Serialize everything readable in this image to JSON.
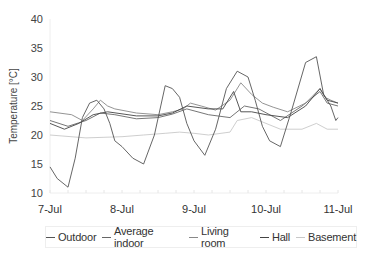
{
  "chart_data": {
    "type": "line",
    "title": "",
    "xlabel": "",
    "ylabel": "Temperature [°C]",
    "ylim": [
      10,
      40
    ],
    "yticks": [
      10,
      15,
      20,
      25,
      30,
      35,
      40
    ],
    "xticks": [
      "7-Jul",
      "8-Jul",
      "9-Jul",
      "10-Jul",
      "11-Jul"
    ],
    "x_unit": "days since 7-Jul",
    "grid": false,
    "legend_position": "bottom",
    "series": [
      {
        "name": "Outdoor",
        "color": "#555555",
        "x": [
          0,
          0.1,
          0.25,
          0.35,
          0.45,
          0.55,
          0.65,
          0.75,
          0.83,
          0.9,
          1.0,
          1.15,
          1.3,
          1.45,
          1.6,
          1.7,
          1.8,
          1.9,
          2.0,
          2.15,
          2.3,
          2.45,
          2.6,
          2.75,
          2.85,
          2.95,
          3.05,
          3.2,
          3.35,
          3.55,
          3.7,
          3.8,
          3.9,
          3.97,
          4.0
        ],
        "y": [
          14.5,
          12.5,
          11.0,
          16.0,
          23.0,
          25.5,
          26.0,
          24.5,
          22.0,
          19.0,
          18.0,
          16.0,
          15.0,
          20.0,
          28.5,
          28.0,
          26.5,
          22.0,
          19.0,
          16.5,
          21.0,
          28.0,
          31.0,
          30.0,
          26.0,
          21.5,
          19.0,
          18.0,
          24.0,
          32.5,
          33.5,
          27.0,
          25.0,
          22.5,
          23.0
        ]
      },
      {
        "name": "Average indoor",
        "color": "#666666",
        "x": [
          0,
          0.25,
          0.5,
          0.7,
          0.9,
          1.2,
          1.5,
          1.7,
          1.9,
          2.2,
          2.5,
          2.7,
          2.9,
          3.2,
          3.5,
          3.75,
          3.85,
          4.0
        ],
        "y": [
          22.5,
          21.5,
          22.5,
          23.8,
          23.5,
          22.8,
          23.0,
          23.6,
          24.5,
          23.5,
          23.0,
          25.0,
          24.5,
          22.5,
          25.0,
          27.5,
          25.5,
          25.0
        ]
      },
      {
        "name": "Living room",
        "color": "#888888",
        "x": [
          0,
          0.3,
          0.45,
          0.6,
          0.7,
          0.8,
          0.9,
          1.2,
          1.5,
          1.7,
          1.85,
          1.95,
          2.1,
          2.3,
          2.5,
          2.65,
          2.8,
          2.95,
          3.1,
          3.3,
          3.55,
          3.75,
          3.82,
          3.9,
          4.0
        ],
        "y": [
          24.0,
          23.5,
          22.5,
          24.5,
          26.0,
          25.0,
          24.5,
          23.8,
          23.5,
          24.0,
          24.5,
          25.5,
          25.0,
          24.3,
          26.0,
          29.0,
          27.0,
          25.5,
          24.8,
          24.0,
          25.5,
          28.0,
          26.5,
          26.0,
          25.5
        ]
      },
      {
        "name": "Hall",
        "color": "#444444",
        "x": [
          0,
          0.2,
          0.4,
          0.6,
          0.8,
          1.2,
          1.5,
          1.7,
          1.9,
          2.2,
          2.4,
          2.55,
          2.65,
          2.8,
          3.0,
          3.3,
          3.55,
          3.75,
          3.85,
          4.0
        ],
        "y": [
          22.0,
          21.0,
          22.0,
          23.5,
          24.0,
          23.3,
          23.3,
          23.8,
          25.0,
          24.5,
          24.5,
          27.5,
          24.0,
          24.0,
          23.5,
          23.0,
          25.0,
          28.0,
          26.0,
          25.5
        ]
      },
      {
        "name": "Basement",
        "color": "#c8c8c8",
        "x": [
          0,
          0.5,
          1.0,
          1.3,
          1.6,
          1.8,
          2.0,
          2.2,
          2.5,
          2.6,
          2.8,
          3.0,
          3.2,
          3.5,
          3.7,
          3.85,
          4.0
        ],
        "y": [
          20.0,
          19.5,
          19.7,
          20.0,
          20.3,
          20.5,
          20.3,
          20.0,
          20.5,
          22.5,
          23.0,
          22.0,
          21.0,
          21.0,
          22.0,
          21.0,
          21.0
        ]
      }
    ]
  },
  "legend": {
    "items": [
      {
        "label": "Outdoor",
        "color": "#555555"
      },
      {
        "label": "Average indoor",
        "color": "#666666"
      },
      {
        "label": "Living room",
        "color": "#888888"
      },
      {
        "label": "Hall",
        "color": "#444444"
      },
      {
        "label": "Basement",
        "color": "#c8c8c8"
      }
    ]
  },
  "axes": {
    "ylabel": "Temperature [°C]"
  }
}
